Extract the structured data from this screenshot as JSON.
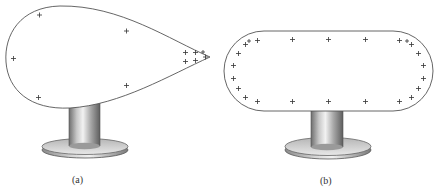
{
  "figure": {
    "panels": [
      {
        "id": "a",
        "caption": "(a)",
        "shape": "teardrop conductor",
        "charge_symbol": "+",
        "charge_count": 11,
        "description": "Pear-shaped conductor on an insulating stand; positive charges concentrate at the sharp point"
      },
      {
        "id": "b",
        "caption": "(b)",
        "shape": "capsule conductor",
        "charge_symbol": "+",
        "charge_count": 24,
        "description": "Rounded-rectangle conductor on an insulating stand; charges distributed along the surface, denser at the curved ends"
      }
    ],
    "figure_number_fragment": "",
    "colors": {
      "outline": "#555555",
      "charge": "#333333",
      "stand_light": "#e6e6e6",
      "stand_dark": "#7a7a7a"
    }
  }
}
